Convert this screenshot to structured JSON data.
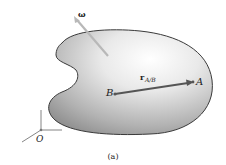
{
  "figure": {
    "caption": "(a)",
    "body": {
      "fill_light": "#f7f7f7",
      "fill_dark": "#8c8c8c",
      "outline": "#3a3a3a"
    },
    "angular_velocity": {
      "symbol": "ω",
      "arrow_color": "#b8b8b8"
    },
    "points": {
      "B": {
        "label": "B"
      },
      "A": {
        "label": "A"
      }
    },
    "position_vector": {
      "symbol": "r",
      "subscript": "A/B",
      "color": "#555555"
    },
    "origin": {
      "label": "O",
      "axis_color": "#777777"
    }
  }
}
